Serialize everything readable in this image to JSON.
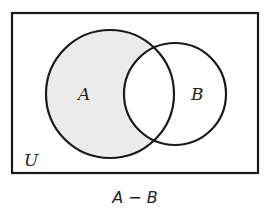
{
  "diagram": {
    "type": "venn",
    "universe": {
      "label": "U",
      "rect": {
        "x": 12,
        "y": 13,
        "width": 246,
        "height": 160
      }
    },
    "sets": [
      {
        "id": "A",
        "label": "A",
        "cx": 110,
        "cy": 94,
        "r": 64,
        "shaded": true
      },
      {
        "id": "B",
        "label": "B",
        "cx": 175,
        "cy": 94,
        "r": 51,
        "shaded": false
      }
    ],
    "shaded_region": "A minus B",
    "caption": "A − B",
    "colors": {
      "stroke": "#1a1a1a",
      "shade": "#ebebeb",
      "background": "#ffffff"
    }
  }
}
